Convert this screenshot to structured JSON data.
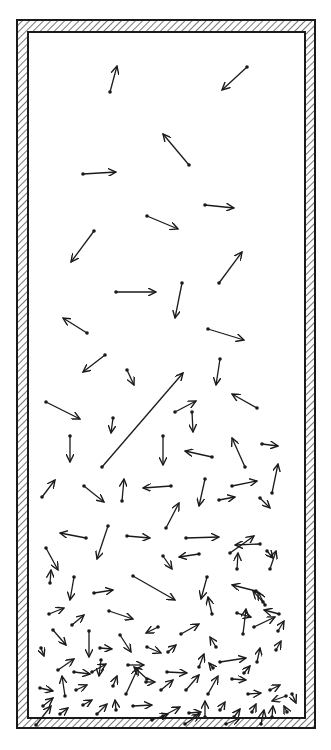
{
  "diagram": {
    "colors": {
      "ink": "#1a1a1a",
      "background": "#ffffff"
    },
    "container": {
      "outer": [
        17,
        20,
        315,
        728
      ],
      "inner": [
        28,
        32,
        305,
        718
      ]
    },
    "arrows": [
      [
        110,
        92,
        117,
        66
      ],
      [
        247,
        67,
        222,
        90
      ],
      [
        189,
        165,
        163,
        134
      ],
      [
        83,
        174,
        116,
        172
      ],
      [
        147,
        216,
        178,
        229
      ],
      [
        205,
        205,
        234,
        208
      ],
      [
        94,
        231,
        71,
        262
      ],
      [
        219,
        283,
        242,
        252
      ],
      [
        116,
        292,
        156,
        292
      ],
      [
        182,
        283,
        175,
        318
      ],
      [
        87,
        333,
        63,
        318
      ],
      [
        208,
        329,
        244,
        340
      ],
      [
        105,
        355,
        83,
        372
      ],
      [
        220,
        359,
        216,
        385
      ],
      [
        127,
        370,
        134,
        385
      ],
      [
        46,
        402,
        80,
        419
      ],
      [
        113,
        418,
        111,
        433
      ],
      [
        70,
        436,
        70,
        462
      ],
      [
        102,
        467,
        183,
        373
      ],
      [
        163,
        436,
        163,
        465
      ],
      [
        175,
        412,
        196,
        401
      ],
      [
        192,
        412,
        193,
        432
      ],
      [
        212,
        457,
        185,
        451
      ],
      [
        257,
        408,
        232,
        394
      ],
      [
        245,
        467,
        232,
        438
      ],
      [
        262,
        444,
        278,
        446
      ],
      [
        272,
        493,
        278,
        464
      ],
      [
        42,
        497,
        55,
        480
      ],
      [
        84,
        486,
        104,
        502
      ],
      [
        122,
        501,
        124,
        479
      ],
      [
        171,
        486,
        143,
        488
      ],
      [
        205,
        479,
        199,
        506
      ],
      [
        232,
        486,
        257,
        481
      ],
      [
        260,
        498,
        270,
        508
      ],
      [
        166,
        528,
        179,
        503
      ],
      [
        108,
        526,
        97,
        559
      ],
      [
        86,
        538,
        60,
        533
      ],
      [
        127,
        536,
        150,
        538
      ],
      [
        186,
        538,
        219,
        537
      ],
      [
        219,
        500,
        235,
        497
      ],
      [
        260,
        544,
        235,
        545
      ],
      [
        199,
        554,
        179,
        557
      ],
      [
        230,
        553,
        254,
        536
      ],
      [
        267,
        551,
        273,
        558
      ],
      [
        46,
        548,
        58,
        570
      ],
      [
        163,
        556,
        172,
        569
      ],
      [
        237,
        569,
        238,
        553
      ],
      [
        270,
        569,
        276,
        551
      ],
      [
        50,
        583,
        51,
        570
      ],
      [
        74,
        577,
        70,
        600
      ],
      [
        94,
        593,
        113,
        590
      ],
      [
        133,
        576,
        175,
        600
      ],
      [
        207,
        577,
        201,
        599
      ],
      [
        256,
        591,
        232,
        585
      ],
      [
        263,
        602,
        253,
        591
      ],
      [
        265,
        605,
        258,
        592
      ],
      [
        49,
        614,
        64,
        608
      ],
      [
        72,
        625,
        84,
        615
      ],
      [
        109,
        611,
        133,
        619
      ],
      [
        158,
        627,
        146,
        633
      ],
      [
        181,
        634,
        199,
        624
      ],
      [
        212,
        614,
        208,
        597
      ],
      [
        237,
        613,
        251,
        617
      ],
      [
        279,
        614,
        264,
        610
      ],
      [
        53,
        630,
        66,
        645
      ],
      [
        89,
        631,
        89,
        657
      ],
      [
        100,
        648,
        112,
        649
      ],
      [
        120,
        635,
        131,
        652
      ],
      [
        147,
        647,
        161,
        653
      ],
      [
        168,
        652,
        176,
        645
      ],
      [
        216,
        647,
        210,
        637
      ],
      [
        243,
        634,
        246,
        609
      ],
      [
        254,
        627,
        275,
        617
      ],
      [
        278,
        631,
        284,
        621
      ],
      [
        41,
        648,
        44,
        656
      ],
      [
        58,
        670,
        74,
        659
      ],
      [
        74,
        672,
        90,
        674
      ],
      [
        101,
        660,
        99,
        676
      ],
      [
        128,
        665,
        144,
        665
      ],
      [
        147,
        679,
        134,
        667
      ],
      [
        167,
        672,
        187,
        673
      ],
      [
        199,
        667,
        204,
        654
      ],
      [
        213,
        668,
        209,
        663
      ],
      [
        220,
        662,
        246,
        658
      ],
      [
        244,
        673,
        250,
        666
      ],
      [
        257,
        662,
        260,
        648
      ],
      [
        276,
        650,
        281,
        641
      ],
      [
        40,
        688,
        53,
        691
      ],
      [
        65,
        696,
        62,
        676
      ],
      [
        76,
        690,
        87,
        685
      ],
      [
        92,
        672,
        106,
        664
      ],
      [
        113,
        686,
        117,
        676
      ],
      [
        126,
        694,
        138,
        668
      ],
      [
        146,
        682,
        155,
        682
      ],
      [
        161,
        690,
        173,
        680
      ],
      [
        186,
        690,
        199,
        675
      ],
      [
        208,
        694,
        218,
        676
      ],
      [
        232,
        679,
        246,
        680
      ],
      [
        248,
        694,
        261,
        693
      ],
      [
        270,
        690,
        280,
        685
      ],
      [
        286,
        696,
        272,
        701
      ],
      [
        43,
        706,
        53,
        698
      ],
      [
        60,
        714,
        68,
        708
      ],
      [
        83,
        705,
        92,
        700
      ],
      [
        97,
        714,
        107,
        704
      ],
      [
        116,
        710,
        115,
        700
      ],
      [
        133,
        706,
        152,
        705
      ],
      [
        163,
        716,
        180,
        707
      ],
      [
        189,
        713,
        201,
        712
      ],
      [
        205,
        717,
        205,
        701
      ],
      [
        220,
        710,
        225,
        702
      ],
      [
        234,
        717,
        240,
        709
      ],
      [
        252,
        712,
        256,
        704
      ],
      [
        272,
        717,
        273,
        706
      ],
      [
        287,
        712,
        284,
        706
      ],
      [
        292,
        694,
        296,
        703
      ],
      [
        36,
        725,
        51,
        706
      ],
      [
        152,
        720,
        168,
        714
      ],
      [
        185,
        724,
        200,
        714
      ],
      [
        226,
        724,
        240,
        718
      ],
      [
        261,
        724,
        264,
        710
      ]
    ]
  }
}
